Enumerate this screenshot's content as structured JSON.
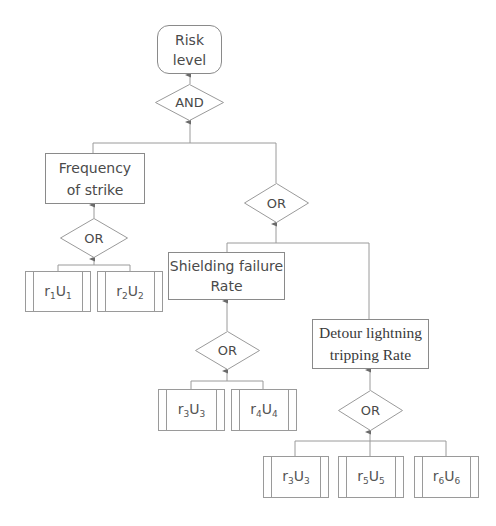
{
  "diagram": {
    "type": "fault-tree",
    "top_event": {
      "label_line1": "Risk",
      "label_line2": "level"
    },
    "top_gate": {
      "label": "AND"
    },
    "frequency": {
      "label": "Frequency of strike",
      "gate": {
        "label": "OR"
      },
      "inputs": [
        {
          "r": "r",
          "r_sub": "1",
          "u": "U",
          "u_sub": "1"
        },
        {
          "r": "r",
          "r_sub": "2",
          "u": "U",
          "u_sub": "2"
        }
      ]
    },
    "rate_gate": {
      "label": "OR"
    },
    "shielding": {
      "label_line1": "Shielding failure",
      "label_line2": "Rate",
      "gate": {
        "label": "OR"
      },
      "inputs": [
        {
          "r": "r",
          "r_sub": "3",
          "u": "U",
          "u_sub": "3"
        },
        {
          "r": "r",
          "r_sub": "4",
          "u": "U",
          "u_sub": "4"
        }
      ]
    },
    "detour": {
      "label_line1": "Detour lightning",
      "label_line2": "tripping Rate",
      "gate": {
        "label": "OR"
      },
      "inputs": [
        {
          "r": "r",
          "r_sub": "3",
          "u": "U",
          "u_sub": "3"
        },
        {
          "r": "r",
          "r_sub": "5",
          "u": "U",
          "u_sub": "5"
        },
        {
          "r": "r",
          "r_sub": "6",
          "u": "U",
          "u_sub": "6"
        }
      ]
    },
    "colors": {
      "line": "#8a8a8a",
      "text": "#4a4a4a",
      "background": "#ffffff"
    }
  }
}
